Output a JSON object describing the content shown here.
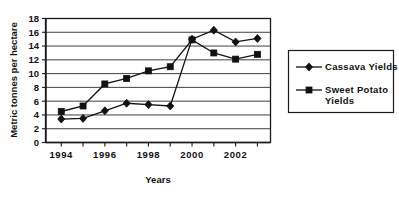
{
  "chart_data": {
    "type": "line",
    "title": "",
    "xlabel": "Years",
    "ylabel": "Metric tonnes per hectare",
    "x": [
      1994,
      1995,
      1996,
      1997,
      1998,
      1999,
      2000,
      2001,
      2002,
      2003
    ],
    "xtick_labels": [
      "1994",
      "1996",
      "1998",
      "2000",
      "2002"
    ],
    "xtick_values": [
      1994,
      1996,
      1998,
      2000,
      2002
    ],
    "ytick_labels": [
      "0",
      "2",
      "4",
      "6",
      "8",
      "10",
      "12",
      "14",
      "16",
      "18"
    ],
    "ytick_values": [
      0,
      2,
      4,
      6,
      8,
      10,
      12,
      14,
      16,
      18
    ],
    "ylim": [
      0,
      18
    ],
    "xlim": [
      1993.3,
      2003.6
    ],
    "grid": "horizontal",
    "legend_position": "right",
    "series": [
      {
        "name": "Cassava Yields",
        "marker": "diamond",
        "values": [
          3.4,
          3.5,
          4.6,
          5.7,
          5.5,
          5.3,
          15.0,
          16.3,
          14.6,
          15.1
        ]
      },
      {
        "name": "Sweet Potato Yields",
        "marker": "square",
        "values": [
          4.5,
          5.3,
          8.5,
          9.3,
          10.4,
          11.0,
          14.9,
          13.0,
          12.1,
          12.8
        ]
      }
    ]
  },
  "legend": {
    "items": [
      {
        "label": "Cassava Yields",
        "marker": "diamond"
      },
      {
        "label": "Sweet Potato Yields",
        "marker": "square"
      }
    ]
  },
  "colors": {
    "ink": "#111111",
    "grid": "#2b2b2b",
    "background": "#ffffff"
  }
}
